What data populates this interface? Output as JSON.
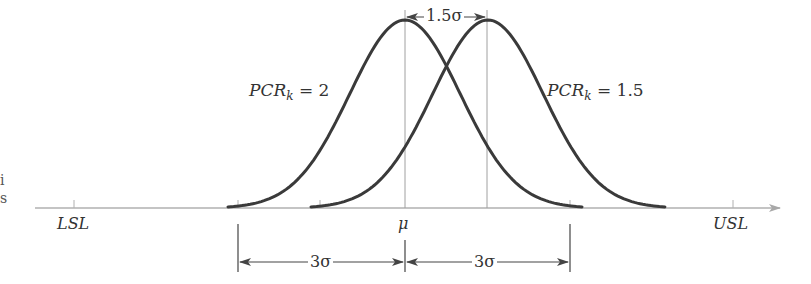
{
  "diagram": {
    "type": "process-capability-normal-curves",
    "axis": {
      "left_label": "LSL",
      "center_label": "μ",
      "right_label": "USL"
    },
    "curves": [
      {
        "label_main": "PCR",
        "label_sub": "k",
        "label_rest": " = 2",
        "mean_offset_sigma": 0
      },
      {
        "label_main": "PCR",
        "label_sub": "k",
        "label_rest": " = 1.5",
        "mean_offset_sigma": 1.5
      }
    ],
    "shift_dimension": {
      "label": "1.5σ"
    },
    "spread_dimensions": [
      {
        "label": "3σ"
      },
      {
        "label": "3σ"
      }
    ],
    "edge_fragments": [
      "i",
      "s"
    ],
    "colors": {
      "curve": "#3a3a3a",
      "axis": "#b0b0b0",
      "guide": "#9a9a9a",
      "dimension": "#444444",
      "text": "#333333"
    }
  }
}
